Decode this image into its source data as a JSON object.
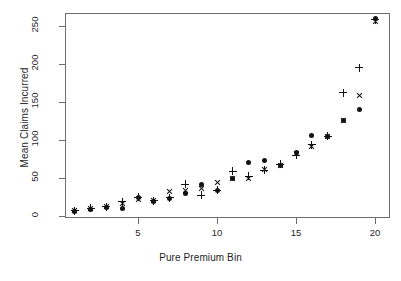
{
  "chart_data": {
    "type": "scatter",
    "title": "",
    "xlabel": "Pure Premium Bin",
    "ylabel": "Mean Claims Incurred",
    "x": [
      1,
      2,
      3,
      4,
      5,
      6,
      7,
      8,
      9,
      10,
      11,
      12,
      13,
      14,
      15,
      16,
      17,
      18,
      19,
      20
    ],
    "xlim": [
      1,
      20
    ],
    "ylim": [
      0,
      265
    ],
    "xticks": [
      5,
      10,
      15,
      20
    ],
    "xticklabels": [
      "5",
      "10",
      "15",
      "20"
    ],
    "yticks": [
      0,
      50,
      100,
      150,
      200,
      250
    ],
    "yticklabels": [
      "0",
      "50",
      "100",
      "150",
      "200",
      "250"
    ],
    "grid": false,
    "legend": "none",
    "series": [
      {
        "name": "circle",
        "marker": "circle",
        "values": [
          6,
          9,
          11,
          10,
          24,
          19,
          23,
          29,
          41,
          33,
          49,
          71,
          73,
          67,
          84,
          106,
          104,
          126,
          140,
          260
        ]
      },
      {
        "name": "plus",
        "marker": "plus",
        "values": [
          7,
          10,
          12,
          19,
          25,
          20,
          24,
          42,
          27,
          34,
          59,
          52,
          60,
          68,
          80,
          94,
          105,
          162,
          195,
          258
        ]
      },
      {
        "name": "cross",
        "marker": "cross",
        "values": [
          7,
          10,
          12,
          17,
          22,
          20,
          32,
          33,
          36,
          44,
          49,
          50,
          61,
          67,
          82,
          92,
          105,
          126,
          158,
          256
        ]
      }
    ]
  }
}
